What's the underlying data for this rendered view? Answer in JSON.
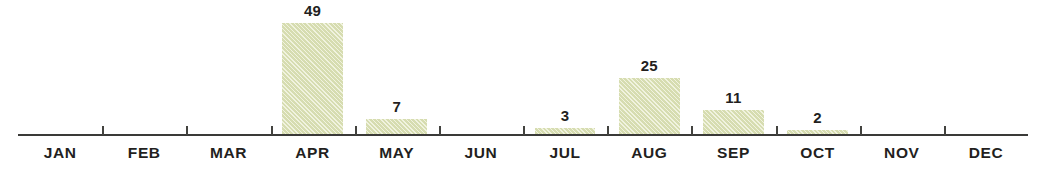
{
  "chart_data": {
    "type": "bar",
    "title": "",
    "subtitle": "",
    "xlabel": "",
    "ylabel": "",
    "categories": [
      "JAN",
      "FEB",
      "MAR",
      "APR",
      "MAY",
      "JUN",
      "JUL",
      "AUG",
      "SEP",
      "OCT",
      "NOV",
      "DEC"
    ],
    "values": [
      0,
      0,
      0,
      49,
      7,
      0,
      3,
      25,
      11,
      2,
      0,
      0
    ],
    "value_labels": [
      "",
      "",
      "",
      "49",
      "7",
      "",
      "3",
      "25",
      "11",
      "2",
      "",
      ""
    ],
    "ylim": [
      0,
      49
    ],
    "grid": false,
    "legend": null,
    "annotations": [],
    "axis": {
      "baseline_visible": true,
      "ticks_between_categories": true,
      "tick_count": 11
    },
    "colors": {
      "bar_fill": "#dfe4b9",
      "bar_hatch": "#c6cea0",
      "axis_line": "#3a3a38",
      "tick": "#43433f",
      "label_text": "#231f1e",
      "background": "#ffffff"
    }
  }
}
